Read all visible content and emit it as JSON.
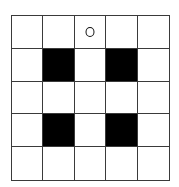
{
  "grid": {
    "rows": 5,
    "cols": 5,
    "colors": {
      "filled": "#000000",
      "empty": "#ffffff",
      "line": "#3a3a3a"
    },
    "cells": [
      [
        "empty",
        "empty",
        "circle",
        "empty",
        "empty"
      ],
      [
        "empty",
        "filled",
        "empty",
        "filled",
        "empty"
      ],
      [
        "empty",
        "empty",
        "empty",
        "empty",
        "empty"
      ],
      [
        "empty",
        "filled",
        "empty",
        "filled",
        "empty"
      ],
      [
        "empty",
        "empty",
        "empty",
        "empty",
        "empty"
      ]
    ],
    "markers": [
      {
        "row": 0,
        "col": 2,
        "type": "circle-outline"
      }
    ],
    "filled_cells": [
      {
        "row": 1,
        "col": 1
      },
      {
        "row": 1,
        "col": 3
      },
      {
        "row": 3,
        "col": 1
      },
      {
        "row": 3,
        "col": 3
      }
    ]
  }
}
